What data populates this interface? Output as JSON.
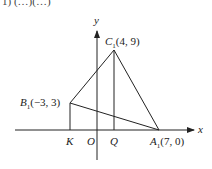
{
  "header_fragment": "1)  (…)(…)",
  "axes": {
    "x_label": "x",
    "y_label": "y",
    "origin_label": "O"
  },
  "points": {
    "A1": {
      "name": "A",
      "sub": "1",
      "coords": "(7, 0)"
    },
    "B1": {
      "name": "B",
      "sub": "1",
      "coords": "(−3, 3)"
    },
    "C1": {
      "name": "C",
      "sub": "1",
      "coords": "(4, 9)"
    },
    "K": {
      "name": "K"
    },
    "Q": {
      "name": "Q"
    }
  },
  "colors": {
    "line": "#222222",
    "background": "#ffffff"
  }
}
